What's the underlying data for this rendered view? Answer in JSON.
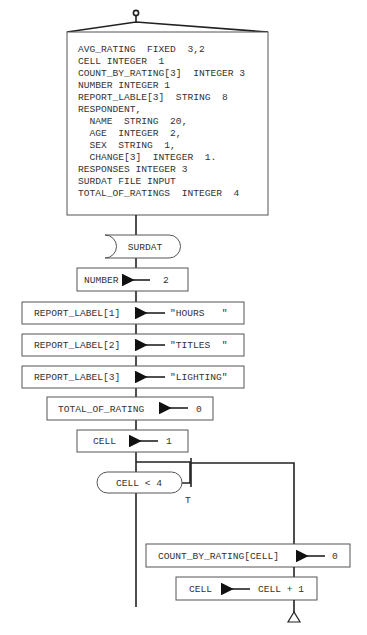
{
  "declarations": {
    "lines": [
      "AVG_RATING  FIXED  3,2",
      "CELL INTEGER  1",
      "COUNT_BY_RATING[3]  INTEGER 3",
      "NUMBER INTEGER 1",
      "REPORT_LABLE[3]  STRING  8",
      "RESPONDENT,",
      "  NAME  STRING  20,",
      "  AGE  INTEGER  2,",
      "  SEX  STRING  1,",
      "  CHANGE[3]  INTEGER  1.",
      "RESPONSES INTEGER 3",
      "SURDAT FILE INPUT",
      "TOTAL_OF_RATINGS  INTEGER  4"
    ]
  },
  "file_open": {
    "label": "SURDAT"
  },
  "assignments": [
    {
      "target": "NUMBER",
      "value": "2"
    },
    {
      "target": "REPORT_LABEL[1]",
      "value": "\"HOURS   \""
    },
    {
      "target": "REPORT_LABEL[2]",
      "value": "\"TITLES  \""
    },
    {
      "target": "REPORT_LABEL[3]",
      "value": "\"LIGHTING\""
    },
    {
      "target": "TOTAL_OF_RATING",
      "value": "0"
    },
    {
      "target": "CELL",
      "value": "1"
    }
  ],
  "loop": {
    "condition": "CELL < 4",
    "true_label": "T",
    "body": [
      {
        "target": "COUNT_BY_RATING[CELL]",
        "value": "0"
      },
      {
        "target": "CELL",
        "value": "CELL + 1"
      }
    ]
  }
}
